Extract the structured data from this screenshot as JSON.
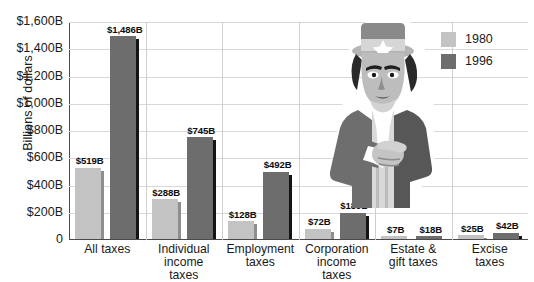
{
  "chart_data": {
    "type": "bar",
    "title": "",
    "xlabel": "",
    "ylabel": "Billions of dollars",
    "ylim": [
      0,
      1600
    ],
    "grid": true,
    "legend_position": "top-right",
    "categories": [
      "All taxes",
      "Individual\nincome\ntaxes",
      "Employment\ntaxes",
      "Corporation\nincome\ntaxes",
      "Estate &\ngift taxes",
      "Excise\ntaxes"
    ],
    "series": [
      {
        "name": "1980",
        "color": "#c3c3c3",
        "values": [
          519,
          288,
          128,
          72,
          7,
          25
        ],
        "labels": [
          "$519B",
          "$288B",
          "$128B",
          "$72B",
          "$7B",
          "$25B"
        ]
      },
      {
        "name": "1996",
        "color": "#6d6d6d",
        "values": [
          1486,
          745,
          492,
          189,
          18,
          42
        ],
        "labels": [
          "$1,486B",
          "$745B",
          "$492B",
          "$189B",
          "$18B",
          "$42B"
        ]
      }
    ],
    "ytick_values": [
      0,
      200,
      400,
      600,
      800,
      1000,
      1200,
      1400,
      1600
    ],
    "ytick_labels": [
      "0",
      "$200B",
      "$400B",
      "$600B",
      "$800B",
      "$1,000B",
      "$1,200B",
      "$1,400B",
      "$1,600B"
    ]
  },
  "legend": {
    "entries": [
      {
        "label": "1980"
      },
      {
        "label": "1996"
      }
    ]
  },
  "illustration": {
    "name": "uncle-sam-pointing"
  }
}
